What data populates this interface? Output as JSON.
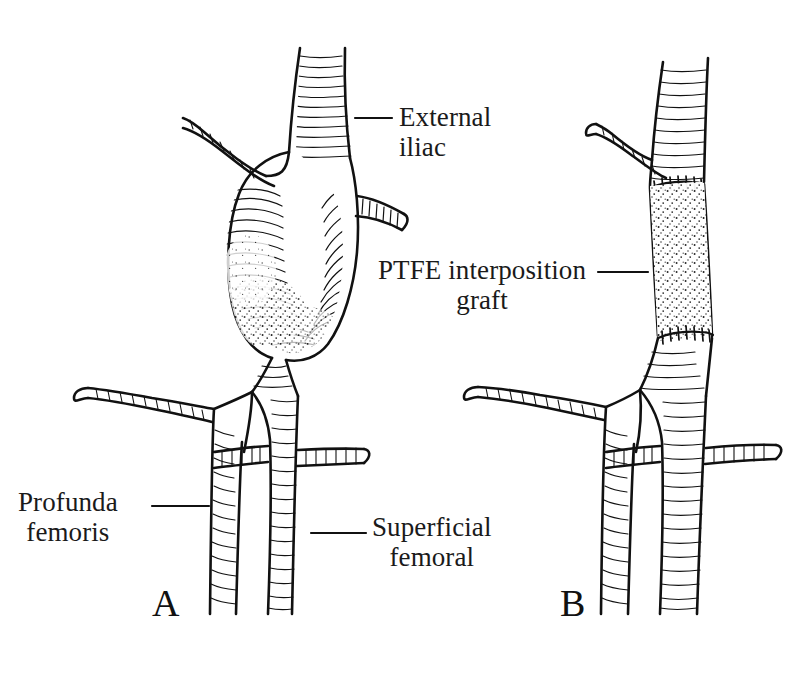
{
  "figure": {
    "kind": "medical-illustration",
    "background_color": "#ffffff",
    "ink_color": "#111111",
    "panels": [
      {
        "id": "A",
        "letter": "A",
        "caption": "Aneurysm of common femoral artery",
        "letter_position": {
          "x": 165,
          "y": 608
        }
      },
      {
        "id": "B",
        "letter": "B",
        "caption": "Repair with PTFE interposition graft",
        "letter_position": {
          "x": 573,
          "y": 608
        }
      }
    ],
    "labels": [
      {
        "id": "external-iliac",
        "text": "External\n   iliac",
        "line1": "External",
        "line2": "iliac",
        "position": {
          "x": 399,
          "y": 102
        },
        "leader": {
          "x1": 355,
          "y1": 118,
          "x2": 392,
          "y2": 118
        }
      },
      {
        "id": "ptfe-graft",
        "text": "PTFE interposition\ngraft",
        "line1": "PTFE interposition",
        "line2": "graft",
        "position": {
          "x": 378,
          "y": 255
        },
        "leader": {
          "x1": 598,
          "y1": 272,
          "x2": 648,
          "y2": 272
        }
      },
      {
        "id": "profunda-femoris",
        "text": "Profunda\nfemoris",
        "line1": "Profunda",
        "line2": "femoris",
        "position": {
          "x": 18,
          "y": 487
        },
        "leader": {
          "x1": 152,
          "y1": 506,
          "x2": 209,
          "y2": 506
        }
      },
      {
        "id": "superficial-femoral",
        "text": "Superficial\nfemoral",
        "line1": "Superficial",
        "line2": "femoral",
        "position": {
          "x": 372,
          "y": 512
        },
        "leader": {
          "x1": 311,
          "y1": 533,
          "x2": 366,
          "y2": 533
        }
      }
    ],
    "anatomy": {
      "panel_a_structures": [
        "external iliac artery",
        "iliac side branch",
        "common femoral artery aneurysm",
        "inguinal side branch",
        "profunda femoris artery",
        "superficial femoral artery",
        "interconnecting branch",
        "lateral branch"
      ],
      "panel_b_structures": [
        "external iliac artery",
        "iliac side branch",
        "proximal anastomosis suture line",
        "PTFE interposition graft",
        "distal anastomosis suture line",
        "profunda femoris artery",
        "superficial femoral artery",
        "interconnecting branch",
        "lateral branch"
      ]
    }
  }
}
